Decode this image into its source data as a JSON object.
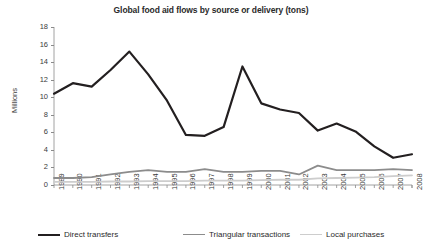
{
  "chart_data": {
    "type": "line",
    "title": "Global food aid flows by source or delivery (tons)",
    "xlabel": "",
    "ylabel": "Millions",
    "ylim": [
      0,
      18
    ],
    "ytick_step": 2,
    "yticks": [
      "0",
      "2",
      "4",
      "6",
      "8",
      "10",
      "12",
      "14",
      "16",
      "18"
    ],
    "grid": false,
    "legend_position": "bottom",
    "categories": [
      "1989",
      "1990",
      "1991",
      "1992",
      "1993",
      "1994",
      "1995",
      "1996",
      "1997",
      "1998",
      "1999",
      "2000",
      "2001",
      "2002",
      "2003",
      "2004",
      "2005",
      "2006",
      "2007",
      "2008"
    ],
    "series": [
      {
        "name": "Direct transfers",
        "color": "#231f20",
        "width": 2.2,
        "values": [
          10.4,
          11.6,
          11.2,
          13.1,
          15.2,
          12.6,
          9.6,
          5.7,
          5.6,
          6.6,
          13.5,
          9.3,
          8.6,
          8.2,
          6.2,
          7.0,
          6.1,
          4.4,
          3.1,
          3.5
        ]
      },
      {
        "name": "Triangular transactions",
        "color": "#8c8c8c",
        "width": 1.8,
        "values": [
          0.8,
          0.8,
          0.9,
          1.2,
          1.5,
          1.7,
          1.5,
          1.5,
          1.8,
          1.5,
          1.5,
          1.6,
          1.6,
          1.2,
          2.2,
          1.7,
          1.7,
          1.7,
          1.8,
          1.7
        ]
      },
      {
        "name": "Local purchases",
        "color": "#cdcdcd",
        "width": 1.8,
        "values": [
          0.35,
          0.35,
          0.35,
          0.4,
          0.4,
          0.45,
          0.45,
          0.45,
          0.5,
          0.5,
          0.5,
          0.55,
          0.6,
          0.6,
          0.75,
          0.8,
          0.85,
          0.9,
          1.0,
          1.1
        ]
      }
    ]
  },
  "axis": {
    "line_color": "#8a8a8a"
  }
}
